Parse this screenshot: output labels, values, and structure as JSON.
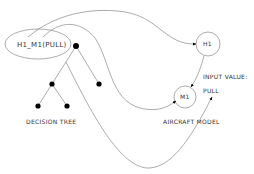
{
  "diagram": {
    "nodes": {
      "decision_node_label": "H1_M1(PULL)",
      "h1_label": "H1",
      "m1_label": "M1"
    },
    "labels": {
      "decision_tree": "DECISION TREE",
      "aircraft_model": "AIRCRAFT MODEL",
      "input_value_title": "INPUT VALUE:",
      "input_value": "PULL"
    },
    "colors": {
      "line": "#888888",
      "dot": "#000000",
      "text": "#333333"
    }
  }
}
